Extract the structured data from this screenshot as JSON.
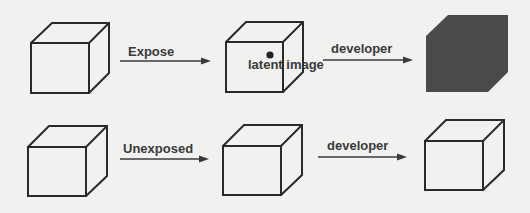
{
  "diagram": {
    "title": "",
    "rows": [
      {
        "name": "exposed",
        "stages": [
          {
            "id": "cube-1",
            "state": "unexposed",
            "label": ""
          },
          {
            "id": "cube-2",
            "state": "latent",
            "label": "latent image"
          },
          {
            "id": "cube-3",
            "state": "developed-dark",
            "label": ""
          }
        ],
        "arrows": [
          {
            "from": "cube-1",
            "to": "cube-2",
            "label": "Expose"
          },
          {
            "from": "cube-2",
            "to": "cube-3",
            "label": "developer"
          }
        ]
      },
      {
        "name": "unexposed",
        "stages": [
          {
            "id": "cube-4",
            "state": "unexposed",
            "label": ""
          },
          {
            "id": "cube-5",
            "state": "unexposed",
            "label": ""
          },
          {
            "id": "cube-6",
            "state": "developed-clear",
            "label": ""
          }
        ],
        "arrows": [
          {
            "from": "cube-4",
            "to": "cube-5",
            "label": "Unexposed"
          },
          {
            "from": "cube-5",
            "to": "cube-6",
            "label": "developer"
          }
        ]
      }
    ],
    "colors": {
      "background": "#f1f1ef",
      "line": "#2a2a2a",
      "dark_cube": "#4a4a48",
      "text": "#3a3a3a"
    }
  }
}
